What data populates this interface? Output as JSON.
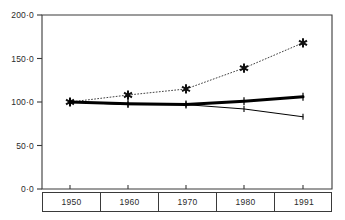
{
  "chart_data": {
    "type": "line",
    "title": "",
    "subtitle": "",
    "xlabel": "",
    "ylabel": "",
    "categories": [
      "1950",
      "1960",
      "1970",
      "1980",
      "1991"
    ],
    "x_tick_labels": [
      "1950",
      "1960",
      "1970",
      "1980",
      "1991"
    ],
    "y_tick_labels": [
      "0·0",
      "50·0",
      "100·0",
      "150·0",
      "200·0"
    ],
    "y_tick_values": [
      0,
      50,
      100,
      150,
      200
    ],
    "ylim": [
      0,
      200
    ],
    "grid": false,
    "legend": "none",
    "series": [
      {
        "name": "series-dotted-star",
        "style": "dotted",
        "marker": "asterisk",
        "color": "#111111",
        "line_width": 0.8,
        "values": [
          100,
          108,
          115,
          139,
          168
        ]
      },
      {
        "name": "series-thick-solid",
        "style": "solid",
        "marker": "plus",
        "color": "#000000",
        "line_width": 3.0,
        "values": [
          100,
          98,
          97,
          101,
          106
        ]
      },
      {
        "name": "series-thin-solid",
        "style": "solid",
        "marker": "tick",
        "color": "#000000",
        "line_width": 1.0,
        "values": [
          100,
          97,
          97,
          92,
          83
        ]
      }
    ]
  },
  "axis": {
    "frame_color": "#3a3a3a",
    "tick_color": "#3a3a3a"
  }
}
